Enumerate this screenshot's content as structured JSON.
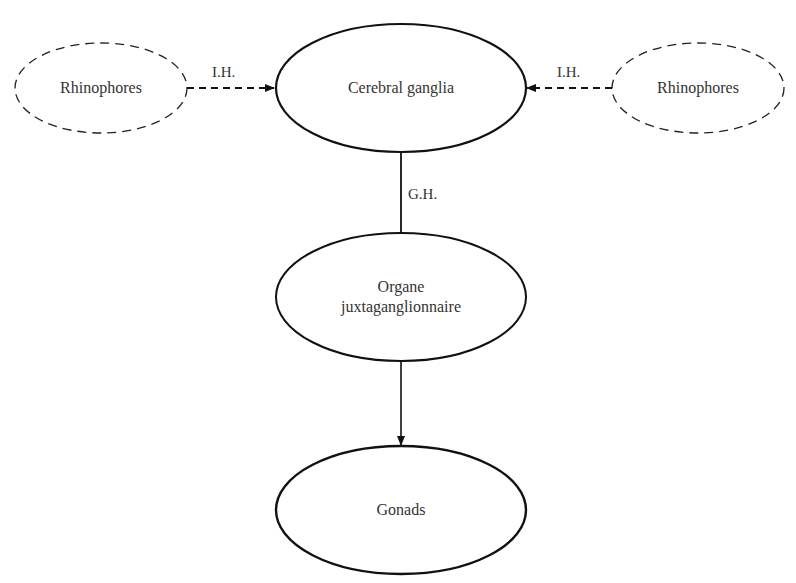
{
  "diagram": {
    "type": "flow",
    "colors": {
      "stroke": "#111111",
      "text": "#333333",
      "background": "#ffffff"
    },
    "nodes": {
      "rhinophores_left": {
        "label": "Rhinophores",
        "style": "dashed"
      },
      "cerebral_ganglia": {
        "label": "Cerebral ganglia",
        "style": "solid"
      },
      "rhinophores_right": {
        "label": "Rhinophores",
        "style": "dashed"
      },
      "organe": {
        "label_line1": "Organe",
        "label_line2": "juxtaganglionnaire",
        "style": "solid"
      },
      "gonads": {
        "label": "Gonads",
        "style": "solid"
      }
    },
    "edges": {
      "left_to_cerebral": {
        "label": "I.H.",
        "style": "dashed",
        "arrow": true
      },
      "right_to_cerebral": {
        "label": "I.H.",
        "style": "dashed",
        "arrow": true
      },
      "cerebral_to_organe": {
        "label": "G.H.",
        "style": "solid",
        "arrow": false
      },
      "organe_to_gonads": {
        "label": "",
        "style": "solid",
        "arrow": true
      }
    }
  }
}
